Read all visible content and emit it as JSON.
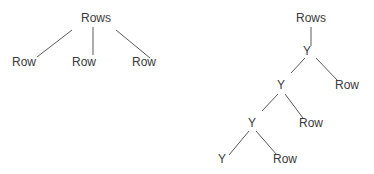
{
  "diagram": {
    "type": "tree",
    "colors": {
      "text": "#3a3a3a",
      "line": "#5a5a5a",
      "background": "#ffffff"
    },
    "left_tree": {
      "root": {
        "label": "Rows",
        "x": 96,
        "y": 22
      },
      "children": [
        {
          "label": "Row",
          "x": 24,
          "y": 66
        },
        {
          "label": "Row",
          "x": 84,
          "y": 66
        },
        {
          "label": "Row",
          "x": 144,
          "y": 66
        }
      ],
      "edges": [
        {
          "x1": 72,
          "y1": 30,
          "x2": 37,
          "y2": 57
        },
        {
          "x1": 93,
          "y1": 27,
          "x2": 93,
          "y2": 55
        },
        {
          "x1": 116,
          "y1": 30,
          "x2": 150,
          "y2": 58
        }
      ]
    },
    "right_tree": {
      "nodes": [
        {
          "id": "root",
          "label": "Rows",
          "x": 311,
          "y": 22
        },
        {
          "id": "y1",
          "label": "Y",
          "x": 307,
          "y": 55
        },
        {
          "id": "y2",
          "label": "Y",
          "x": 281,
          "y": 89
        },
        {
          "id": "row1",
          "label": "Row",
          "x": 347,
          "y": 89
        },
        {
          "id": "y3",
          "label": "Y",
          "x": 252,
          "y": 127
        },
        {
          "id": "row2",
          "label": "Row",
          "x": 311,
          "y": 127
        },
        {
          "id": "y4",
          "label": "Y",
          "x": 222,
          "y": 163
        },
        {
          "id": "row3",
          "label": "Row",
          "x": 285,
          "y": 163
        }
      ],
      "edges": [
        {
          "x1": 311,
          "y1": 27,
          "x2": 311,
          "y2": 46
        },
        {
          "x1": 305,
          "y1": 58,
          "x2": 291,
          "y2": 73
        },
        {
          "x1": 316,
          "y1": 58,
          "x2": 338,
          "y2": 81
        },
        {
          "x1": 278,
          "y1": 94,
          "x2": 262,
          "y2": 111
        },
        {
          "x1": 285,
          "y1": 94,
          "x2": 303,
          "y2": 118
        },
        {
          "x1": 249,
          "y1": 131,
          "x2": 229,
          "y2": 155
        },
        {
          "x1": 256,
          "y1": 131,
          "x2": 277,
          "y2": 155
        }
      ]
    }
  }
}
